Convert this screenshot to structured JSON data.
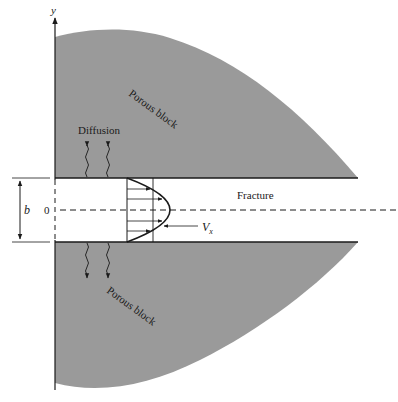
{
  "diagram": {
    "axis_label_y": "y",
    "upper_block_label": "Porous block",
    "lower_block_label": "Porous block",
    "diffusion_label": "Diffusion",
    "fracture_label": "Fracture",
    "aperture_label": "b",
    "origin_label": "0",
    "velocity_label": "V",
    "velocity_subscript": "x",
    "colors": {
      "block_fill": "#9a9a9a",
      "line": "#1a1a1a",
      "background": "#ffffff"
    }
  }
}
